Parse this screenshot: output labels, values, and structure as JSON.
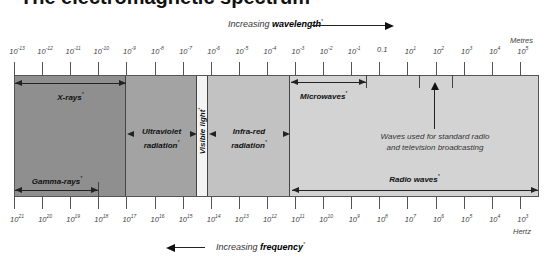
{
  "title": "The electromagnetic spectrum",
  "wavelength_axis": {
    "caption_prefix": "Increasing ",
    "caption_bold": "wavelength",
    "caption_mark": "*",
    "unit": "Metres",
    "labels": [
      {
        "base": "10",
        "exp": "-13"
      },
      {
        "base": "10",
        "exp": "-12"
      },
      {
        "base": "10",
        "exp": "-11"
      },
      {
        "base": "10",
        "exp": "-10"
      },
      {
        "base": "10",
        "exp": "-9"
      },
      {
        "base": "10",
        "exp": "-8"
      },
      {
        "base": "10",
        "exp": "-7"
      },
      {
        "base": "10",
        "exp": "-6"
      },
      {
        "base": "10",
        "exp": "-5"
      },
      {
        "base": "10",
        "exp": "-4"
      },
      {
        "base": "10",
        "exp": "-3"
      },
      {
        "base": "10",
        "exp": "-2"
      },
      {
        "base": "10",
        "exp": "-1"
      },
      {
        "base": "0.1",
        "exp": ""
      },
      {
        "base": "10",
        "exp": "1"
      },
      {
        "base": "10",
        "exp": "2"
      },
      {
        "base": "10",
        "exp": "3"
      },
      {
        "base": "10",
        "exp": "4"
      },
      {
        "base": "10",
        "exp": "5"
      }
    ]
  },
  "frequency_axis": {
    "caption_prefix": "Increasing ",
    "caption_bold": "frequency",
    "caption_mark": "*",
    "unit": "Hertz",
    "labels": [
      {
        "base": "10",
        "exp": "21"
      },
      {
        "base": "10",
        "exp": "20"
      },
      {
        "base": "10",
        "exp": "19"
      },
      {
        "base": "10",
        "exp": "18"
      },
      {
        "base": "10",
        "exp": "17"
      },
      {
        "base": "10",
        "exp": "16"
      },
      {
        "base": "10",
        "exp": "15"
      },
      {
        "base": "10",
        "exp": "14"
      },
      {
        "base": "10",
        "exp": "13"
      },
      {
        "base": "10",
        "exp": "12"
      },
      {
        "base": "10",
        "exp": "11"
      },
      {
        "base": "10",
        "exp": "10"
      },
      {
        "base": "10",
        "exp": "9"
      },
      {
        "base": "10",
        "exp": "8"
      },
      {
        "base": "10",
        "exp": "7"
      },
      {
        "base": "10",
        "exp": "6"
      },
      {
        "base": "10",
        "exp": "5"
      },
      {
        "base": "10",
        "exp": "4"
      },
      {
        "base": "10",
        "exp": "3"
      }
    ]
  },
  "bands": {
    "xrays": "X-rays",
    "gamma": "Gamma-rays",
    "uv_line1": "Ultraviolet",
    "uv_line2": "radiation",
    "visible": "Visible light",
    "ir_line1": "Infra-red",
    "ir_line2": "radiation",
    "microwaves": "Microwaves",
    "radio": "Radio waves",
    "mark": "*"
  },
  "note": {
    "line1": "Waves used for standard radio",
    "line2": "and television broadcasting"
  },
  "colors": {
    "xray_region": "#8f8f8f",
    "uv_region": "#a3a3a3",
    "visible_region": "#f4f4f4",
    "ir_region": "#c2c2c2",
    "radio_region": "#d3d3d3"
  }
}
